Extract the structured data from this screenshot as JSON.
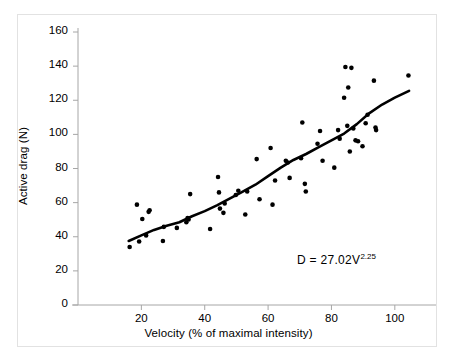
{
  "chart_data": {
    "type": "scatter",
    "title": "",
    "subtitle": "",
    "xlabel": "Velocity (% of maximal intensity)",
    "ylabel": "Active drag (N)",
    "xlim": [
      0,
      113
    ],
    "ylim": [
      0,
      160
    ],
    "xticks": [
      20,
      40,
      60,
      80,
      100
    ],
    "yticks": [
      0,
      20,
      40,
      60,
      80,
      100,
      120,
      140,
      160
    ],
    "grid": false,
    "legend": null,
    "annotations": [
      {
        "name": "regression-equation",
        "text_prefix": "D = 27.02V",
        "text_exponent": "2.25",
        "full_text": "D = 27.02V2.25",
        "x": 78,
        "y": 24
      }
    ],
    "series": [
      {
        "name": "Active drag measurements",
        "type": "scatter",
        "marker": "filled-circle",
        "color": "#000000",
        "points": [
          [
            16.3,
            34.0
          ],
          [
            18.6,
            58.8
          ],
          [
            19.3,
            37.2
          ],
          [
            20.3,
            50.4
          ],
          [
            21.5,
            40.8
          ],
          [
            22.6,
            55.5
          ],
          [
            22.3,
            54.6
          ],
          [
            26.8,
            37.5
          ],
          [
            27.1,
            45.8
          ],
          [
            31.2,
            45.2
          ],
          [
            34.2,
            48.5
          ],
          [
            34.6,
            51.0
          ],
          [
            34.9,
            50.1
          ],
          [
            35.4,
            65.0
          ],
          [
            41.7,
            44.5
          ],
          [
            44.2,
            75.0
          ],
          [
            44.5,
            66.0
          ],
          [
            44.8,
            56.5
          ],
          [
            45.9,
            54.0
          ],
          [
            46.3,
            59.5
          ],
          [
            49.8,
            64.5
          ],
          [
            50.6,
            67.0
          ],
          [
            52.8,
            53.0
          ],
          [
            53.4,
            66.5
          ],
          [
            56.4,
            85.5
          ],
          [
            57.3,
            62.0
          ],
          [
            60.8,
            92.0
          ],
          [
            61.4,
            58.8
          ],
          [
            62.2,
            73.0
          ],
          [
            65.6,
            84.5
          ],
          [
            66.2,
            83.5
          ],
          [
            66.8,
            74.5
          ],
          [
            70.8,
            107.0
          ],
          [
            70.4,
            86.0
          ],
          [
            71.6,
            71.0
          ],
          [
            71.9,
            66.5
          ],
          [
            75.6,
            94.5
          ],
          [
            76.4,
            102.0
          ],
          [
            77.2,
            84.5
          ],
          [
            80.9,
            80.5
          ],
          [
            82.1,
            102.5
          ],
          [
            82.6,
            97.5
          ],
          [
            84.0,
            121.5
          ],
          [
            84.4,
            139.5
          ],
          [
            85.0,
            105.0
          ],
          [
            85.3,
            127.5
          ],
          [
            85.8,
            90.0
          ],
          [
            86.3,
            139.0
          ],
          [
            86.9,
            103.5
          ],
          [
            87.6,
            96.5
          ],
          [
            88.4,
            96.0
          ],
          [
            89.8,
            93.0
          ],
          [
            90.8,
            106.5
          ],
          [
            91.4,
            111.5
          ],
          [
            93.4,
            131.5
          ],
          [
            93.9,
            104.0
          ],
          [
            94.1,
            102.5
          ],
          [
            104.3,
            134.5
          ]
        ]
      },
      {
        "name": "Power-law fit curve",
        "type": "line",
        "color": "#000000",
        "equation": "D = 27.02V^2.25",
        "x_range": [
          16.0,
          104.5
        ],
        "points": [
          [
            16.0,
            37.5
          ],
          [
            20.0,
            40.8
          ],
          [
            24.0,
            44.0
          ],
          [
            28.0,
            46.5
          ],
          [
            32.0,
            48.5
          ],
          [
            36.0,
            52.0
          ],
          [
            40.0,
            55.0
          ],
          [
            44.0,
            58.5
          ],
          [
            48.0,
            62.5
          ],
          [
            52.0,
            66.5
          ],
          [
            56.0,
            70.5
          ],
          [
            60.0,
            75.5
          ],
          [
            64.0,
            80.5
          ],
          [
            68.0,
            85.0
          ],
          [
            72.0,
            88.5
          ],
          [
            76.0,
            92.5
          ],
          [
            80.0,
            96.5
          ],
          [
            84.0,
            100.5
          ],
          [
            88.0,
            106.0
          ],
          [
            92.0,
            112.5
          ],
          [
            96.0,
            117.5
          ],
          [
            100.0,
            121.5
          ],
          [
            104.5,
            125.5
          ]
        ]
      }
    ]
  },
  "axis": {
    "x_tick_labels": [
      "20",
      "40",
      "60",
      "80",
      "100"
    ],
    "y_tick_labels": [
      "0",
      "20",
      "40",
      "60",
      "80",
      "100",
      "120",
      "140",
      "160"
    ],
    "axis_color": "#a6a6a6",
    "text_color": "#000000"
  }
}
